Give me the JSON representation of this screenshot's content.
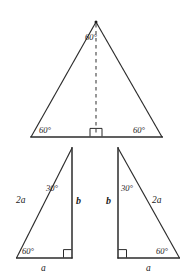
{
  "figure": {
    "background_color": "#ffffff",
    "line_color": "#2b2b2b",
    "text_color": "#1a1a1a"
  },
  "equilateral_triangle": {
    "name": "equilateral-triangle",
    "apex_angle_label": "60°",
    "left_base_angle_label": "60°",
    "right_base_angle_label": "60°",
    "altitude_style": "dashed",
    "right_angle_marker": true
  },
  "left_right_triangle": {
    "name": "left-right-triangle",
    "top_angle_label": "30°",
    "bottom_angle_label": "60°",
    "hypotenuse_label": "2a",
    "vertical_leg_label": "b",
    "horizontal_leg_label": "a",
    "right_angle_marker": true
  },
  "right_right_triangle": {
    "name": "right-right-triangle",
    "top_angle_label": "30°",
    "bottom_angle_label": "60°",
    "hypotenuse_label": "2a",
    "vertical_leg_label": "b",
    "horizontal_leg_label": "a",
    "right_angle_marker": true
  }
}
